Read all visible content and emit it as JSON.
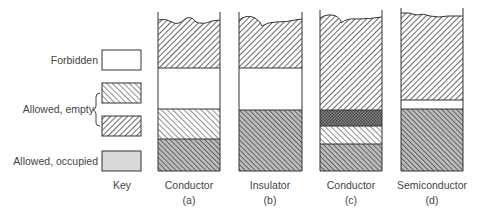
{
  "key": {
    "title": "Key",
    "items": [
      {
        "label": "Forbidden",
        "pattern": "white"
      },
      {
        "label": "Allowed, empty",
        "pattern": "hatch-forward-light"
      },
      {
        "label": "Allowed, empty",
        "pattern": "hatch-back"
      },
      {
        "label": "Allowed, occupied",
        "pattern": "gray-fill"
      }
    ],
    "forbidden_label": "Forbidden",
    "empty_label": "Allowed, empty",
    "occupied_label": "Allowed, occupied"
  },
  "columns": [
    {
      "caption": "Conductor",
      "tag": "(a)",
      "bands": [
        "hatch-back (top, wavy)",
        "white",
        "hatch-forward-light",
        "hatch-forward-dark"
      ]
    },
    {
      "caption": "Insulator",
      "tag": "(b)",
      "bands": [
        "hatch-back (top, wavy)",
        "white",
        "hatch-forward-dark"
      ]
    },
    {
      "caption": "Conductor",
      "tag": "(c)",
      "bands": [
        "hatch-back (top, wavy)",
        "cross-hatch overlap",
        "hatch-forward-light",
        "hatch-forward-dark"
      ]
    },
    {
      "caption": "Semiconductor",
      "tag": "(d)",
      "bands": [
        "hatch-back (top, wavy)",
        "white (narrow gap)",
        "hatch-forward-dark"
      ]
    }
  ],
  "colors": {
    "line": "#333333",
    "hatch": "#555555",
    "background": "#ffffff"
  }
}
